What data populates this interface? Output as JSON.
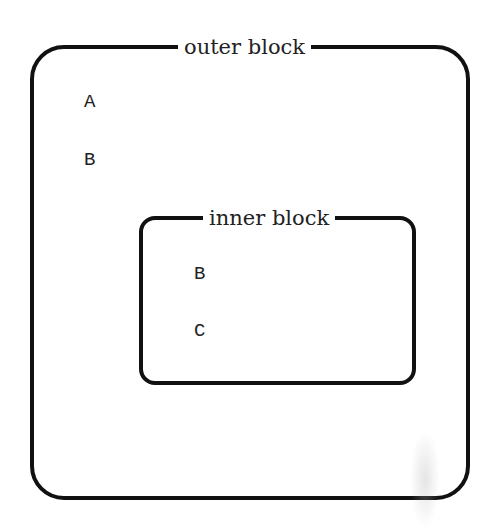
{
  "diagram": {
    "outer_block": {
      "label": "outer block",
      "items": [
        "A",
        "B"
      ]
    },
    "inner_block": {
      "label": "inner block",
      "items": [
        "B",
        "C"
      ]
    }
  }
}
